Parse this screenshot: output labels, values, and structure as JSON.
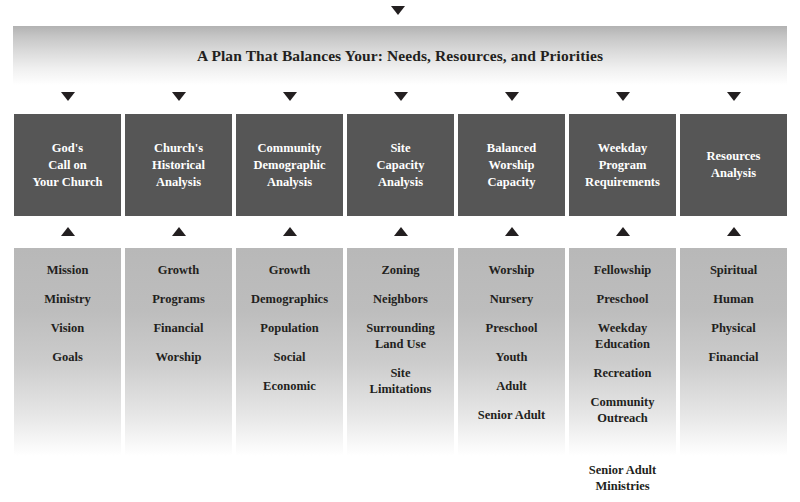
{
  "banner": {
    "title": "A Plan That Balances Your: Needs, Resources, and Priorities"
  },
  "icons": {
    "arrow_down": "triangle-down-icon",
    "arrow_up": "triangle-up-icon"
  },
  "colors": {
    "dark_box": "#565656",
    "dark_box_text": "#ffffff",
    "text": "#231f20",
    "banner_gradient_top": "#b2b2b2",
    "banner_gradient_bottom": "#ffffff",
    "column_gradient_top": "#b8b8b8",
    "column_gradient_bottom": "#ffffff"
  },
  "columns": [
    {
      "heading": "God's\nCall on\nYour Church",
      "heading_lines": [
        "God's",
        "Call on",
        "Your Church"
      ],
      "items": [
        "Mission",
        "Ministry",
        "Vision",
        "Goals"
      ],
      "overflow_items": []
    },
    {
      "heading": "Church's\nHistorical\nAnalysis",
      "heading_lines": [
        "Church's",
        "Historical",
        "Analysis"
      ],
      "items": [
        "Growth",
        "Programs",
        "Financial",
        "Worship"
      ],
      "overflow_items": []
    },
    {
      "heading": "Community\nDemographic\nAnalysis",
      "heading_lines": [
        "Community",
        "Demographic",
        "Analysis"
      ],
      "items": [
        "Growth",
        "Demographics",
        "Population",
        "Social",
        "Economic"
      ],
      "overflow_items": []
    },
    {
      "heading": "Site\nCapacity\nAnalysis",
      "heading_lines": [
        "Site",
        "Capacity",
        "Analysis"
      ],
      "items": [
        "Zoning",
        "Neighbors",
        "Surrounding\nLand Use",
        "Site\nLimitations"
      ],
      "overflow_items": []
    },
    {
      "heading": "Balanced\nWorship\nCapacity",
      "heading_lines": [
        "Balanced",
        "Worship",
        "Capacity"
      ],
      "items": [
        "Worship",
        "Nursery",
        "Preschool",
        "Youth",
        "Adult",
        "Senior Adult"
      ],
      "overflow_items": []
    },
    {
      "heading": "Weekday\nProgram\nRequirements",
      "heading_lines": [
        "Weekday",
        "Program",
        "Requirements"
      ],
      "items": [
        "Fellowship",
        "Preschool",
        "Weekday\nEducation",
        "Recreation",
        "Community\nOutreach"
      ],
      "overflow_items": [
        "Senior Adult\nMinistries"
      ]
    },
    {
      "heading": "Resources\nAnalysis",
      "heading_lines": [
        "Resources",
        "Analysis"
      ],
      "items": [
        "Spiritual",
        "Human",
        "Physical",
        "Financial"
      ],
      "overflow_items": []
    }
  ]
}
